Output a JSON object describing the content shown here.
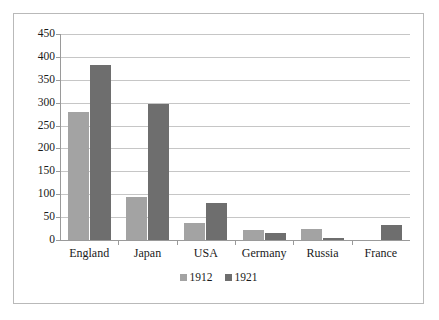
{
  "chart_data": {
    "type": "bar",
    "title": "",
    "subtitle": "",
    "xlabel": "",
    "ylabel": "",
    "categories": [
      "England",
      "Japan",
      "USA",
      "Germany",
      "Russia",
      "France"
    ],
    "series": [
      {
        "name": "1912",
        "color": "#a3a3a3",
        "values": [
          280,
          95,
          38,
          22,
          23,
          0
        ]
      },
      {
        "name": "1921",
        "color": "#6e6e6e",
        "values": [
          383,
          297,
          80,
          15,
          4,
          32
        ]
      }
    ],
    "ylim": [
      0,
      450
    ],
    "yticks": [
      0,
      50,
      100,
      150,
      200,
      250,
      300,
      350,
      400,
      450
    ],
    "ytick_labels": [
      "0",
      "50",
      "100",
      "150",
      "200",
      "250",
      "300",
      "350",
      "400",
      "450"
    ],
    "grid": true,
    "grid_axis": "y",
    "legend": [
      "1912",
      "1921"
    ],
    "legend_position": "bottom",
    "border": true
  }
}
